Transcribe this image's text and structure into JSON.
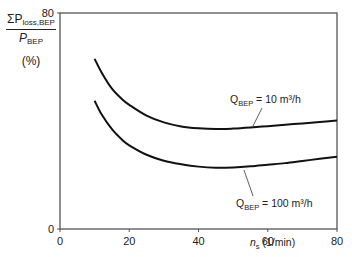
{
  "chart_data": {
    "type": "line",
    "title": "",
    "xlabel": "n_s (1/min)",
    "xlabel_var": "n",
    "xlabel_sub": "s",
    "xlabel_unit": "(1/min)",
    "ylabel": "ΣP_loss,BEP / P_BEP (%)",
    "ylabel_num_sym": "ΣP",
    "ylabel_num_sub": "loss,BEP",
    "ylabel_den_sym": "P",
    "ylabel_den_sub": "BEP",
    "ylabel_unit": "(%)",
    "xlim": [
      0,
      80
    ],
    "ylim": [
      0,
      80
    ],
    "xticks": [
      0,
      20,
      40,
      60,
      80
    ],
    "yticks": [
      0,
      80
    ],
    "grid": false,
    "legend": "inline annotations",
    "series": [
      {
        "name": "Q_BEP = 10 m³/h",
        "label_prefix": "Q",
        "label_sub": "BEP",
        "label_suffix": " = 10 m³/h",
        "x": [
          10,
          12,
          15,
          18,
          20,
          25,
          30,
          35,
          40,
          45,
          50,
          55,
          60,
          65,
          70,
          75,
          80
        ],
        "y": [
          63,
          58,
          52,
          48,
          46,
          42,
          39.5,
          38,
          37.3,
          37,
          37.2,
          37.6,
          38.1,
          38.6,
          39.1,
          39.6,
          40.2
        ]
      },
      {
        "name": "Q_BEP = 100 m³/h",
        "label_prefix": "Q",
        "label_sub": "BEP",
        "label_suffix": " = 100 m³/h",
        "x": [
          10,
          12,
          15,
          18,
          20,
          25,
          30,
          35,
          40,
          45,
          50,
          55,
          60,
          65,
          70,
          75,
          80
        ],
        "y": [
          47.5,
          42.5,
          37,
          33,
          31,
          27.5,
          25.3,
          24,
          23.1,
          22.7,
          22.8,
          23.2,
          23.8,
          24.4,
          25.2,
          26,
          26.8
        ]
      }
    ]
  }
}
